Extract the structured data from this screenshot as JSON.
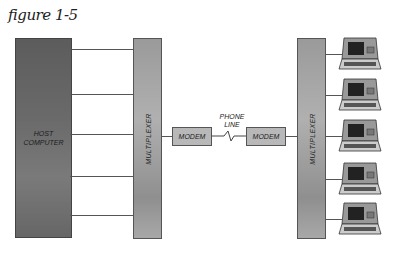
{
  "figure": {
    "title": "figure 1-5"
  },
  "host": {
    "label_line1": "HOST",
    "label_line2": "COMPUTER"
  },
  "multiplexer_left": {
    "label": "MULTIPLEXER"
  },
  "multiplexer_right": {
    "label": "MULTIPLEXER"
  },
  "modem_left": {
    "label": "MODEM"
  },
  "modem_right": {
    "label": "MODEM"
  },
  "phone_line": {
    "line1": "PHONE",
    "line2": "LINE"
  },
  "terminals": {
    "count": 5
  },
  "colors": {
    "host": "#666666",
    "multiplexer": "#a0a0a0",
    "modem": "#b8b8b8",
    "line": "#555555"
  }
}
